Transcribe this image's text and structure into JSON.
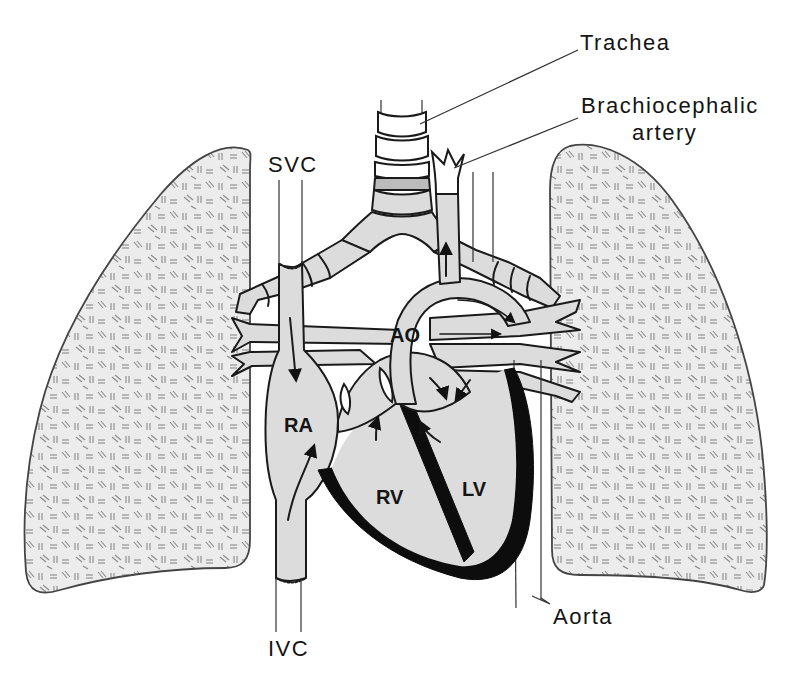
{
  "figure": {
    "type": "anatomical-diagram",
    "colors": {
      "background": "#ffffff",
      "tissue_fill": "#dcdcdc",
      "outline": "#1a1a1a",
      "myocardium": "#0d0d0d",
      "lung_texture": "#8a8a8a"
    }
  },
  "labels": {
    "outer": {
      "trachea": "Trachea",
      "brachiocephalic_line1": "Brachiocephalic",
      "brachiocephalic_line2": "artery",
      "svc": "SVC",
      "ivc": "IVC",
      "aorta": "Aorta"
    },
    "inner": {
      "ao": "AO",
      "ra": "RA",
      "rv": "RV",
      "lv": "LV"
    }
  },
  "structures": [
    {
      "id": "right-lung",
      "side": "viewer-left"
    },
    {
      "id": "left-lung",
      "side": "viewer-right"
    },
    {
      "id": "trachea"
    },
    {
      "id": "bronchi"
    },
    {
      "id": "superior-vena-cava"
    },
    {
      "id": "inferior-vena-cava"
    },
    {
      "id": "right-atrium"
    },
    {
      "id": "right-ventricle"
    },
    {
      "id": "left-ventricle"
    },
    {
      "id": "aortic-arch"
    },
    {
      "id": "brachiocephalic-artery"
    },
    {
      "id": "descending-aorta"
    },
    {
      "id": "pulmonary-vessels"
    }
  ]
}
